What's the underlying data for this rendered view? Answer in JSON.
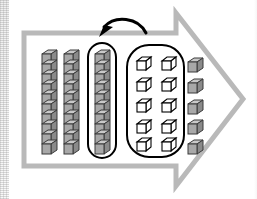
{
  "scene": {
    "title": "base-ten blocks regrouping diagram",
    "background_color": "#ffffff",
    "width": 257,
    "height": 199
  },
  "arrow_banner": {
    "name": "right-pointing-arrow-outline",
    "direction": "right",
    "stroke_color": "#b9b9b9",
    "fill_color": "#ffffff",
    "stroke_width": 5
  },
  "rods": {
    "label": "tens rods",
    "count": 3,
    "cubes_per_rod": 10,
    "fill_color": "#a8a8a8",
    "top_face_color": "#c9c9c9",
    "side_face_color": "#8e8e8e",
    "stroke_color": "#3a3a3a",
    "items": [
      {
        "id": "rod-1",
        "cubes": 10,
        "circled": "false"
      },
      {
        "id": "rod-2",
        "cubes": 10,
        "circled": "false"
      },
      {
        "id": "rod-3",
        "cubes": 10,
        "circled": "true"
      }
    ]
  },
  "circled_rod_outline": {
    "name": "stadium-outline-around-third-rod",
    "stroke_color": "#000000",
    "stroke_width": 2
  },
  "units_group": {
    "label": "ones group of ten unit cubes",
    "count": 10,
    "columns": 2,
    "rows": 5,
    "cube_fill": "#ffffff",
    "cube_stroke": "#000000",
    "outline_shape": "rounded-rectangle",
    "outline_stroke": "#000000",
    "outline_stroke_width": 2
  },
  "loose_units": {
    "label": "loose unit cubes",
    "count": 5,
    "fill_color": "#a8a8a8",
    "top_face_color": "#c9c9c9",
    "side_face_color": "#8e8e8e",
    "stroke_color": "#3a3a3a"
  },
  "curved_arrow": {
    "name": "regroup-curved-arrow",
    "points_to": "third rod",
    "color": "#000000",
    "stroke_width": 3
  },
  "scan_artifact": {
    "name": "left-edge-noise-strip",
    "visible": "true"
  }
}
